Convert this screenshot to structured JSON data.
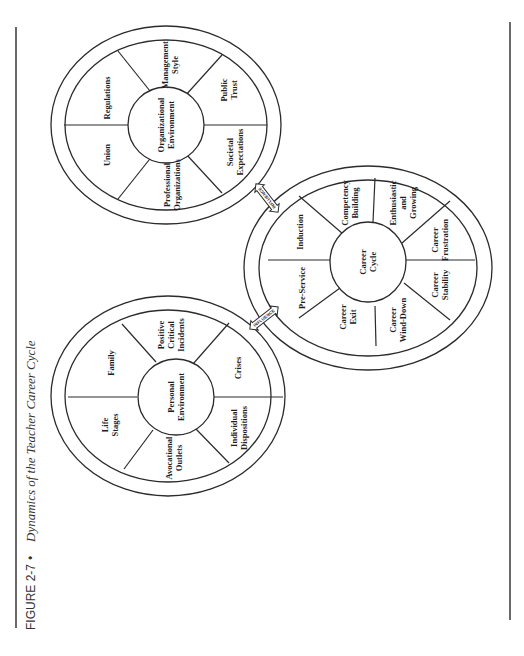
{
  "caption": {
    "figure_label": "FIGURE 2-7",
    "separator": "•",
    "title": "Dynamics of the Teacher Career Cycle"
  },
  "colors": {
    "line": "#2b2b2b",
    "text": "#1e1e1e",
    "background": "#ffffff"
  },
  "wheels": {
    "organizational": {
      "hub": [
        "Organizational",
        "Environment"
      ],
      "segments": [
        [
          "Regulations"
        ],
        [
          "Management",
          "Style"
        ],
        [
          "Public",
          "Trust"
        ],
        [
          "Societal",
          "Expectations"
        ],
        [
          "Professional",
          "Organizations"
        ],
        [
          "Union"
        ]
      ]
    },
    "career": {
      "hub": [
        "Career",
        "Cycle"
      ],
      "segments": [
        [
          "Induction"
        ],
        [
          "Competency",
          "Building"
        ],
        [
          "Enthusiastic",
          "and",
          "Growing"
        ],
        [
          "Career",
          "Frustration"
        ],
        [
          "Career",
          "Stability"
        ],
        [
          "Career",
          "Wind-Down"
        ],
        [
          "Career",
          "Exit"
        ],
        [
          "Pre-Service"
        ]
      ]
    },
    "personal": {
      "hub": [
        "Personal",
        "Environment"
      ],
      "segments": [
        [
          "Family"
        ],
        [
          "Positive",
          "Critical",
          "Incidents"
        ],
        [
          "Crises"
        ],
        [
          "Individual",
          "Dispositions"
        ],
        [
          "Avocational",
          "Outlets"
        ],
        [
          "Life",
          "Stages"
        ]
      ]
    }
  },
  "arrows": {
    "upper": "INFLUENCE",
    "lower": "INFLUENCE"
  }
}
